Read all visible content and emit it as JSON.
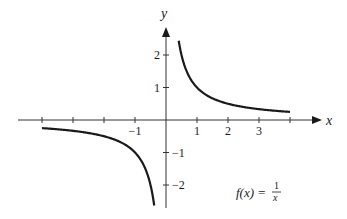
{
  "chart_data": {
    "type": "line",
    "title": "",
    "function_label": "f(x) = 1/x",
    "function_label_parts": {
      "lhs": "f(x) =",
      "numerator": "1",
      "denominator": "x"
    },
    "xlabel": "x",
    "ylabel": "y",
    "xlim": [
      -4.8,
      5.1
    ],
    "ylim": [
      -2.7,
      2.9
    ],
    "x_ticks": [
      -4,
      -3,
      -2,
      -1,
      1,
      2,
      3,
      4
    ],
    "x_tick_labels": [
      {
        "value": -1,
        "label": "−1"
      },
      {
        "value": 1,
        "label": "1"
      },
      {
        "value": 2,
        "label": "2"
      },
      {
        "value": 3,
        "label": "3"
      }
    ],
    "y_ticks": [
      -2,
      -1,
      1,
      2
    ],
    "y_tick_labels": [
      {
        "value": 2,
        "label": "2"
      },
      {
        "value": 1,
        "label": "1"
      },
      {
        "value": -1,
        "label": "−1"
      },
      {
        "value": -2,
        "label": "−2"
      }
    ],
    "grid": false,
    "legend": null,
    "series": [
      {
        "name": "right branch",
        "x": [
          0.41,
          0.5,
          0.75,
          1,
          1.5,
          2,
          2.5,
          3,
          3.5,
          4
        ],
        "y": [
          2.44,
          2.0,
          1.33,
          1.0,
          0.67,
          0.5,
          0.4,
          0.33,
          0.29,
          0.25
        ]
      },
      {
        "name": "left branch",
        "x": [
          -4,
          -3.5,
          -3,
          -2.5,
          -2,
          -1.5,
          -1,
          -0.75,
          -0.5,
          -0.38
        ],
        "y": [
          -0.25,
          -0.29,
          -0.33,
          -0.4,
          -0.5,
          -0.67,
          -1.0,
          -1.33,
          -2.0,
          -2.63
        ]
      }
    ],
    "colors": {
      "curve": "#1a1a1a",
      "axis": "#333333"
    }
  }
}
